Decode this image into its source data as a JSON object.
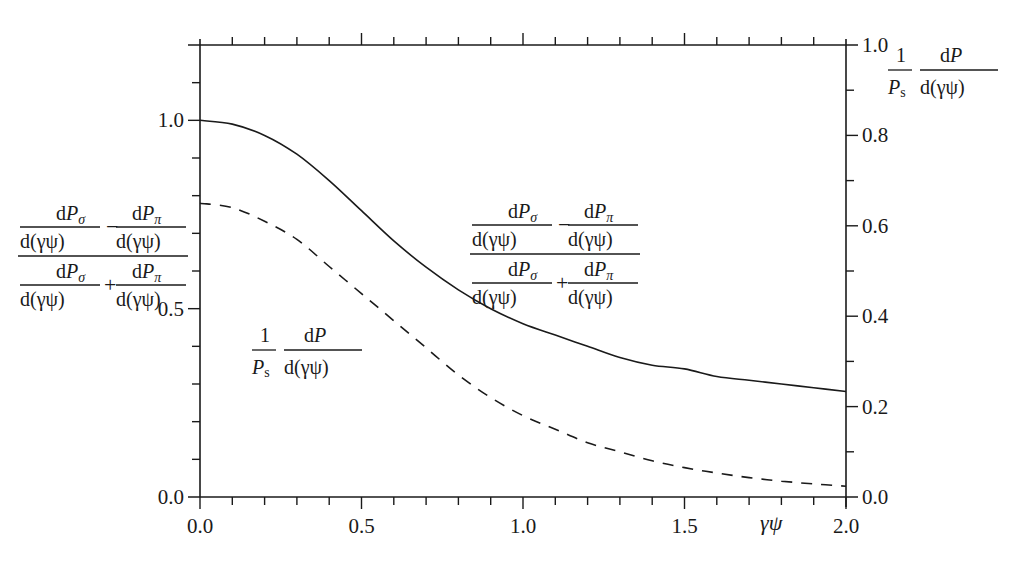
{
  "chart_data": {
    "type": "line",
    "title": "",
    "xlabel": "γψ",
    "ylabel_left": "(dPσ/d(γψ) − dPπ/d(γψ)) / (dPσ/d(γψ) + dPπ/d(γψ))",
    "ylabel_right": "(1/Ps) dP/d(γψ)",
    "xlim": [
      0.0,
      2.0
    ],
    "ylim_left": [
      0.0,
      1.2
    ],
    "ylim_right": [
      0.0,
      1.0
    ],
    "x_ticks": [
      "0.0",
      "0.5",
      "1.0",
      "1.5",
      "2.0"
    ],
    "x_minor_step": 0.1,
    "y_left_ticks": [
      "0.0",
      "0.5",
      "1.0"
    ],
    "y_left_minor_step": 0.1,
    "y_right_ticks": [
      "0.0",
      "0.2",
      "0.4",
      "0.6",
      "0.8",
      "1.0"
    ],
    "y_right_minor_step": 0.1,
    "grid": false,
    "legend": "inline annotations",
    "x": [
      0.0,
      0.1,
      0.2,
      0.3,
      0.4,
      0.5,
      0.6,
      0.7,
      0.8,
      0.9,
      1.0,
      1.1,
      1.2,
      1.3,
      1.4,
      1.5,
      1.6,
      1.7,
      1.8,
      1.9,
      2.0
    ],
    "series": [
      {
        "name": "polarization ratio (dPσ − dPπ)/(dPσ + dPπ)",
        "axis": "left",
        "style": "solid",
        "values": [
          1.0,
          0.99,
          0.96,
          0.91,
          0.84,
          0.76,
          0.68,
          0.61,
          0.55,
          0.5,
          0.46,
          0.43,
          0.4,
          0.37,
          0.35,
          0.34,
          0.32,
          0.31,
          0.3,
          0.29,
          0.28
        ]
      },
      {
        "name": "(1/Ps) dP/d(γψ)",
        "axis": "right",
        "style": "dashed",
        "values": [
          0.65,
          0.64,
          0.61,
          0.57,
          0.51,
          0.45,
          0.39,
          0.33,
          0.27,
          0.22,
          0.18,
          0.15,
          0.12,
          0.1,
          0.08,
          0.065,
          0.053,
          0.043,
          0.035,
          0.029,
          0.024
        ]
      }
    ],
    "annotations": [
      {
        "text": "(dPσ/d(γψ) − dPπ/d(γψ)) / (dPσ/d(γψ) + dPπ/d(γψ))",
        "target": "solid curve",
        "position": "center-right"
      },
      {
        "text": "(1/Ps) dP/d(γψ)",
        "target": "dashed curve",
        "position": "center-left"
      }
    ]
  },
  "labels": {
    "x_axis": "γψ",
    "x_ticks": [
      "0.0",
      "0.5",
      "1.0",
      "1.5",
      "2.0"
    ],
    "y_left_ticks": [
      "0.0",
      "0.5",
      "1.0"
    ],
    "y_right_ticks": [
      "0.0",
      "0.2",
      "0.4",
      "0.6",
      "0.8",
      "1.0"
    ],
    "dP": "d",
    "P": "P",
    "sigma": "σ",
    "pi": "π",
    "minus": "−",
    "plus": "+",
    "denom": "d(γψ)",
    "one": "1",
    "Ps_P": "P",
    "Ps_s": "s"
  }
}
